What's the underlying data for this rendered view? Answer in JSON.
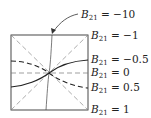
{
  "figure": {
    "type": "parameter-curve-family",
    "parameter_symbol": "B",
    "parameter_subscript": "21",
    "curves": [
      {
        "value": "−10",
        "label": "B21 = −10",
        "style": "thin-solid-near-vertical",
        "callout": "arrow"
      },
      {
        "value": "−1",
        "label": "B21 = −1",
        "style": "dashed-diagonal"
      },
      {
        "value": "−0.5",
        "label": "B21 = −0.5",
        "style": "solid-and-dashed-sigmoid"
      },
      {
        "value": "0",
        "label": "B21 = 0",
        "style": "dashed-horizontal"
      },
      {
        "value": "0.5",
        "label": "B21 = 0.5",
        "style": "solid-and-dashed-sigmoid"
      },
      {
        "value": "1",
        "label": "B21 = 1",
        "style": "dashed-diagonal"
      }
    ],
    "colors": {
      "line": "#222222",
      "dash": "#777777",
      "background": "#ffffff"
    }
  }
}
